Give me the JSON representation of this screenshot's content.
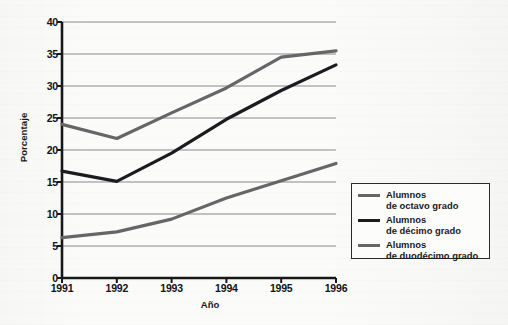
{
  "chart_data": {
    "type": "line",
    "title": "",
    "xlabel": "Año",
    "ylabel": "Porcentaje",
    "categories": [
      "1991",
      "1992",
      "1993",
      "1994",
      "1995",
      "1996"
    ],
    "x": [
      1991,
      1992,
      1993,
      1994,
      1995,
      1996
    ],
    "xlim": [
      1991,
      1996
    ],
    "ylim": [
      0,
      40
    ],
    "yticks": [
      0,
      5,
      10,
      15,
      20,
      25,
      30,
      35,
      40
    ],
    "ytick_labels": [
      "0",
      "5",
      "10",
      "15",
      "20",
      "25",
      "30",
      "35",
      "40"
    ],
    "grid": "horizontal",
    "legend_position": "bottom-right-outside",
    "series": [
      {
        "name": "Alumnos\nde octavo grado",
        "label_line1": "Alumnos",
        "label_line2": "de octavo grado",
        "color": "#666668",
        "values": [
          6.3,
          7.2,
          9.2,
          12.5,
          15.2,
          17.9
        ]
      },
      {
        "name": "Alumnos\nde décimo grado",
        "label_line1": "Alumnos",
        "label_line2": "de décimo grado",
        "color": "#1c1c20",
        "values": [
          16.7,
          15.1,
          19.5,
          24.8,
          29.3,
          33.3
        ]
      },
      {
        "name": "Alumnos\nde duodécimo grado",
        "label_line1": "Alumnos",
        "label_line2": "de duodécimo grado",
        "color": "#666668",
        "values": [
          24.0,
          21.8,
          25.8,
          29.7,
          34.5,
          35.5
        ]
      }
    ]
  },
  "axes": {
    "y_title": "Porcentaje",
    "x_title": "Año"
  },
  "colors": {
    "axis": "#18181b",
    "grid": "#8a8a8d",
    "series_gray": "#666668",
    "series_black": "#1c1c20",
    "legend_border": "#2a2a2e",
    "background": "#fbfbfa"
  }
}
